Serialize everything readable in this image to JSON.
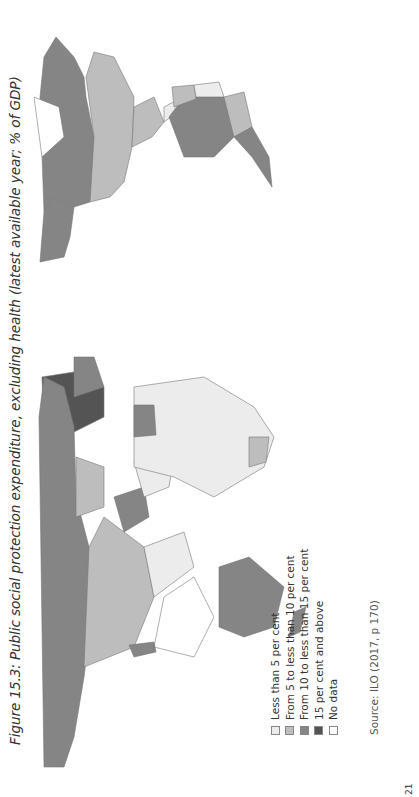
{
  "figure": {
    "title": "Figure 15.3: Public social protection expenditure, excluding health (latest available year; % of GDP)",
    "orientation": "rotated 90° counter-clockwise",
    "source": "Source: ILO (2017, p 170)",
    "page_number": "21"
  },
  "legend": {
    "items": [
      {
        "label": "Less than 5 per cent",
        "color": "#ececec"
      },
      {
        "label": "From 5 to less than 10 per cent",
        "color": "#bdbdbd"
      },
      {
        "label": "From 10 to less than 15 per cent",
        "color": "#858585"
      },
      {
        "label": "15 per cent and above",
        "color": "#545454"
      },
      {
        "label": "No data",
        "color": "#ffffff"
      }
    ]
  },
  "map": {
    "regions": [
      {
        "name": "Canada",
        "category": "From 10 to less than 15 per cent"
      },
      {
        "name": "United States",
        "category": "From 5 to less than 10 per cent"
      },
      {
        "name": "Alaska",
        "category": "From 10 to less than 15 per cent"
      },
      {
        "name": "Mexico",
        "category": "From 5 to less than 10 per cent"
      },
      {
        "name": "Brazil",
        "category": "From 10 to less than 15 per cent"
      },
      {
        "name": "Argentina",
        "category": "From 10 to less than 15 per cent"
      },
      {
        "name": "Chile",
        "category": "From 10 to less than 15 per cent"
      },
      {
        "name": "Russia",
        "category": "From 10 to less than 15 per cent"
      },
      {
        "name": "China",
        "category": "From 5 to less than 10 per cent"
      },
      {
        "name": "India",
        "category": "Less than 5 per cent"
      },
      {
        "name": "Australia",
        "category": "From 10 to less than 15 per cent"
      },
      {
        "name": "Western Europe",
        "category": "15 per cent and above"
      },
      {
        "name": "Africa",
        "category": "Less than 5 per cent"
      },
      {
        "name": "Kazakhstan",
        "category": "From 5 to less than 10 per cent"
      },
      {
        "name": "Iran",
        "category": "From 10 to less than 15 per cent"
      },
      {
        "name": "South Africa",
        "category": "From 5 to less than 10 per cent"
      }
    ]
  }
}
